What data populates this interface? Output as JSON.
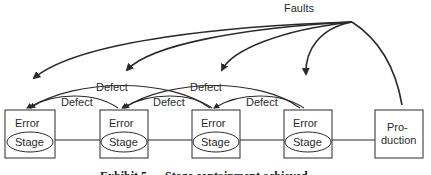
{
  "diagram": {
    "faults_label": "Faults",
    "defect_label": "Defect",
    "stages": [
      {
        "top": "Error",
        "bottom": "Stage"
      },
      {
        "top": "Error",
        "bottom": "Stage"
      },
      {
        "top": "Error",
        "bottom": "Stage"
      },
      {
        "top": "Error",
        "bottom": "Stage"
      }
    ],
    "production": {
      "line1": "Pro-",
      "line2": "duction"
    },
    "defect_labels": [
      {
        "text": "Defect"
      },
      {
        "text": "Defect"
      },
      {
        "text": "Defect"
      },
      {
        "text": "Defect"
      },
      {
        "text": "Defect"
      }
    ],
    "caption": "Exhibit 5 — Stage containment achieved",
    "colors": {
      "line": "#2a2a2a",
      "background": "#ffffff"
    }
  }
}
